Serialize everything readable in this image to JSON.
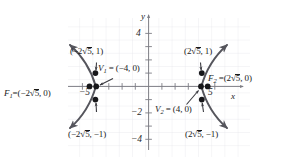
{
  "figure": {
    "kind": "hyperbola-graph",
    "axis_labels": {
      "x": "x",
      "y": "y"
    },
    "x_ticks": [
      {
        "value": -5,
        "label": "−5"
      },
      {
        "value": 5,
        "label": "5"
      }
    ],
    "y_ticks": [
      {
        "value": 4,
        "label": "4"
      },
      {
        "value": -2,
        "label": "−2"
      },
      {
        "value": -4,
        "label": "−4"
      }
    ],
    "annotations": {
      "upper_left_point": "(−2√5, 1)",
      "lower_left_point": "(−2√5, −1)",
      "upper_right_point": "(2√5, 1)",
      "lower_right_point": "(2√5, −1)",
      "vertex_left": "V₁ = (−4, 0)",
      "vertex_right": "V₂ = (4, 0)",
      "focus_left": "F₁ = (−2√5, 0)",
      "focus_right": "F₂ = (2√5, 0)"
    },
    "points": [
      {
        "name": "focus-left",
        "x": -4.472,
        "y": 0
      },
      {
        "name": "vertex-left",
        "x": -4,
        "y": 0
      },
      {
        "name": "left-upper",
        "x": -4.472,
        "y": 1
      },
      {
        "name": "left-lower",
        "x": -4.472,
        "y": -1
      },
      {
        "name": "focus-right",
        "x": 4.472,
        "y": 0
      },
      {
        "name": "vertex-right",
        "x": 4,
        "y": 0
      },
      {
        "name": "right-upper",
        "x": 4.472,
        "y": 1
      },
      {
        "name": "right-lower",
        "x": 4.472,
        "y": -1
      }
    ],
    "colors": {
      "grid": "#e4e4e8",
      "axis": "#7d7d84",
      "curve": "#55555c",
      "text": "#1a1a1a"
    }
  }
}
